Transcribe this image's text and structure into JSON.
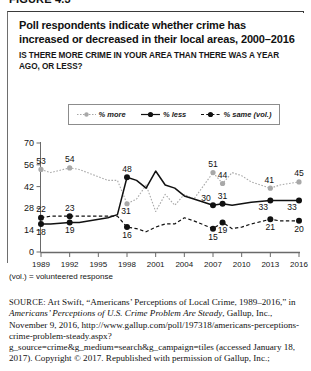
{
  "figure": {
    "number": "FIGURE 4.3"
  },
  "header": {
    "title": "Poll respondents indicate whether crime has increased or decreased in their local areas, 2000–2016",
    "subtitle": "IS THERE MORE CRIME IN YOUR AREA THAN THERE WAS A YEAR AGO, OR LESS?"
  },
  "legend": {
    "items": [
      {
        "label": "% more",
        "color": "#a8a8a8",
        "style": "dotted",
        "icon": "line-marker-more"
      },
      {
        "label": "% less",
        "color": "#111111",
        "style": "solid",
        "icon": "line-marker-less"
      },
      {
        "label": "% same (vol.)",
        "color": "#111111",
        "style": "dashed",
        "icon": "line-marker-same"
      }
    ]
  },
  "notes": {
    "vol": "(vol.) = volunteered response"
  },
  "source": {
    "label": "SOURCE:",
    "text_1": " Art Swift, “Americans’ Perceptions of Local Crime, 1989–2016,” in ",
    "italic_1": "Americans’ Perceptions of U.S. Crime Problem Are Steady",
    "text_2": ", Gallup, Inc., November 9, 2016, http://www.gallup.com/poll/197318/americans-perceptions-crime-problem-steady.aspx?g_source=crime&g_medium=search&g_campaign=tiles (accessed January 18, 2017). Copyright © 2017. Republished with permission of Gallup, Inc.;"
  },
  "chart_data": {
    "type": "line",
    "title": "Poll respondents indicate whether crime has increased or decreased in their local areas, 2000–2016",
    "xlabel": "",
    "ylabel": "",
    "xlim": [
      1989,
      2016
    ],
    "ylim": [
      0,
      70
    ],
    "yticks": [
      0,
      14,
      28,
      42,
      56,
      70
    ],
    "xticks": [
      1989,
      1992,
      1995,
      1998,
      2001,
      2004,
      2007,
      2010,
      2013,
      2016
    ],
    "grid": false,
    "legend_position": "top",
    "series": [
      {
        "name": "% more",
        "color": "#a8a8a8",
        "style": "dotted",
        "points": [
          {
            "x": 1989,
            "y": 53,
            "label": "53"
          },
          {
            "x": 1990,
            "y": 51,
            "label": null
          },
          {
            "x": 1992,
            "y": 54,
            "label": "54"
          },
          {
            "x": 1993,
            "y": 53,
            "label": null
          },
          {
            "x": 1996,
            "y": 46,
            "label": null
          },
          {
            "x": 1997,
            "y": 46,
            "label": null
          },
          {
            "x": 1998,
            "y": 31,
            "label": "31"
          },
          {
            "x": 1999,
            "y": 34,
            "label": null
          },
          {
            "x": 2000,
            "y": 43,
            "label": null
          },
          {
            "x": 2001,
            "y": 26,
            "label": null
          },
          {
            "x": 2002,
            "y": 37,
            "label": null
          },
          {
            "x": 2003,
            "y": 30,
            "label": null
          },
          {
            "x": 2004,
            "y": 37,
            "label": null
          },
          {
            "x": 2005,
            "y": 34,
            "label": null
          },
          {
            "x": 2007,
            "y": 51,
            "label": "51"
          },
          {
            "x": 2008,
            "y": 44,
            "label": "44"
          },
          {
            "x": 2009,
            "y": 51,
            "label": null
          },
          {
            "x": 2010,
            "y": 49,
            "label": null
          },
          {
            "x": 2011,
            "y": 45,
            "label": null
          },
          {
            "x": 2013,
            "y": 41,
            "label": "41"
          },
          {
            "x": 2014,
            "y": 43,
            "label": null
          },
          {
            "x": 2016,
            "y": 45,
            "label": "45"
          }
        ]
      },
      {
        "name": "% less",
        "color": "#111111",
        "style": "solid",
        "points": [
          {
            "x": 1989,
            "y": 18,
            "label": "18"
          },
          {
            "x": 1990,
            "y": 18,
            "label": null
          },
          {
            "x": 1992,
            "y": 19,
            "label": "19"
          },
          {
            "x": 1993,
            "y": 19,
            "label": null
          },
          {
            "x": 1996,
            "y": 22,
            "label": null
          },
          {
            "x": 1997,
            "y": 24,
            "label": null
          },
          {
            "x": 1998,
            "y": 48,
            "label": "48"
          },
          {
            "x": 1999,
            "y": 46,
            "label": null
          },
          {
            "x": 2000,
            "y": 41,
            "label": null
          },
          {
            "x": 2001,
            "y": 52,
            "label": null
          },
          {
            "x": 2002,
            "y": 43,
            "label": null
          },
          {
            "x": 2003,
            "y": 41,
            "label": null
          },
          {
            "x": 2004,
            "y": 36,
            "label": null
          },
          {
            "x": 2005,
            "y": 34,
            "label": null
          },
          {
            "x": 2007,
            "y": 30,
            "label": "30"
          },
          {
            "x": 2008,
            "y": 31,
            "label": "31"
          },
          {
            "x": 2009,
            "y": 30,
            "label": null
          },
          {
            "x": 2010,
            "y": 31,
            "label": null
          },
          {
            "x": 2011,
            "y": 32,
            "label": null
          },
          {
            "x": 2013,
            "y": 33,
            "label": "33"
          },
          {
            "x": 2014,
            "y": 33,
            "label": null
          },
          {
            "x": 2016,
            "y": 33,
            "label": "33"
          }
        ]
      },
      {
        "name": "% same (vol.)",
        "color": "#111111",
        "style": "dashed",
        "points": [
          {
            "x": 1989,
            "y": 22,
            "label": "22"
          },
          {
            "x": 1990,
            "y": 23,
            "label": null
          },
          {
            "x": 1992,
            "y": 23,
            "label": "23"
          },
          {
            "x": 1993,
            "y": 23,
            "label": null
          },
          {
            "x": 1996,
            "y": 23,
            "label": null
          },
          {
            "x": 1997,
            "y": 23,
            "label": null
          },
          {
            "x": 1998,
            "y": 16,
            "label": "16"
          },
          {
            "x": 1999,
            "y": 15,
            "label": null
          },
          {
            "x": 2000,
            "y": 13,
            "label": null
          },
          {
            "x": 2001,
            "y": 16,
            "label": null
          },
          {
            "x": 2002,
            "y": 18,
            "label": null
          },
          {
            "x": 2003,
            "y": 18,
            "label": null
          },
          {
            "x": 2004,
            "y": 22,
            "label": null
          },
          {
            "x": 2005,
            "y": 20,
            "label": null
          },
          {
            "x": 2007,
            "y": 15,
            "label": "15"
          },
          {
            "x": 2008,
            "y": 19,
            "label": "19"
          },
          {
            "x": 2009,
            "y": 15,
            "label": null
          },
          {
            "x": 2010,
            "y": 16,
            "label": null
          },
          {
            "x": 2011,
            "y": 18,
            "label": null
          },
          {
            "x": 2013,
            "y": 21,
            "label": "21"
          },
          {
            "x": 2014,
            "y": 20,
            "label": null
          },
          {
            "x": 2016,
            "y": 20,
            "label": "20"
          }
        ]
      }
    ]
  }
}
